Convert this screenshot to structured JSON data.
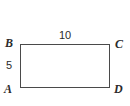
{
  "figure": {
    "kind": "rectangle-diagram",
    "background_color": "#ffffff",
    "stroke_color": "#4a4a4a",
    "text_color": "#2b2b2b",
    "vertices": [
      {
        "id": "B",
        "label": "B",
        "position": "top-left"
      },
      {
        "id": "C",
        "label": "C",
        "position": "top-right"
      },
      {
        "id": "A",
        "label": "A",
        "position": "bottom-left"
      },
      {
        "id": "D",
        "label": "D",
        "position": "bottom-right"
      }
    ],
    "measurements": [
      {
        "id": "top",
        "label": "10",
        "side": "BC",
        "placement": "above-top-edge"
      },
      {
        "id": "left",
        "label": "5",
        "side": "AB",
        "placement": "left-of-left-edge"
      }
    ]
  }
}
